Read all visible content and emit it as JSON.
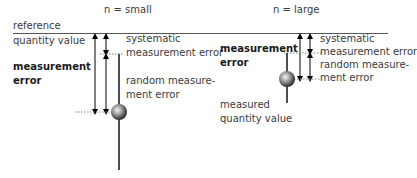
{
  "headers": {
    "left": "n = small",
    "right": "n = large"
  },
  "reference": {
    "line1": "reference",
    "line2": "quantity value"
  },
  "left_panel": {
    "error_label": {
      "line1": "measurement",
      "line2": "error"
    },
    "systematic": {
      "line1": "systematic",
      "line2": "measurement error"
    },
    "random": {
      "line1": "random measure-",
      "line2": "ment error"
    }
  },
  "right_panel": {
    "error_label": {
      "line1": "measurement",
      "line2": "error"
    },
    "systematic": {
      "line1": "systematic",
      "line2": "measurement error"
    },
    "random": {
      "line1": "random measure-",
      "line2": "ment error"
    },
    "measured": {
      "line1": "measured",
      "line2": "quantity value"
    }
  },
  "colors": {
    "line": "#000000",
    "dotted": "#888888",
    "text": "#3a3a3a"
  }
}
